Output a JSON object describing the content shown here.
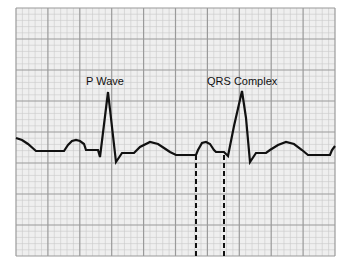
{
  "diagram": {
    "type": "ecg-strip",
    "labels": {
      "p_wave": "P Wave",
      "qrs_complex": "QRS Complex"
    },
    "colors": {
      "background": "#ffffff",
      "grid_fill": "#efefef",
      "grid_minor": "#c9c9c9",
      "grid_major": "#9a9a9a",
      "trace": "#111111",
      "marker": "#111111"
    },
    "grid": {
      "left": 16,
      "top": 8,
      "right": 335,
      "bottom": 256,
      "major_cols": 10,
      "major_rows": 8,
      "minor_per_major": 5
    },
    "trace_points": [
      [
        16,
        138
      ],
      [
        22,
        140
      ],
      [
        28,
        144
      ],
      [
        36,
        151
      ],
      [
        44,
        151
      ],
      [
        52,
        151
      ],
      [
        60,
        151
      ],
      [
        64,
        151
      ],
      [
        68,
        145
      ],
      [
        72,
        141
      ],
      [
        76,
        140
      ],
      [
        80,
        141
      ],
      [
        84,
        144
      ],
      [
        86,
        150
      ],
      [
        94,
        150
      ],
      [
        98,
        150
      ],
      [
        100,
        157
      ],
      [
        108,
        92
      ],
      [
        116,
        162
      ],
      [
        122,
        153
      ],
      [
        130,
        153
      ],
      [
        134,
        153
      ],
      [
        140,
        147
      ],
      [
        150,
        142
      ],
      [
        158,
        144
      ],
      [
        164,
        148
      ],
      [
        170,
        152
      ],
      [
        176,
        155
      ],
      [
        182,
        155
      ],
      [
        190,
        155
      ],
      [
        196,
        155
      ],
      [
        198,
        150
      ],
      [
        202,
        143
      ],
      [
        206,
        142
      ],
      [
        210,
        144
      ],
      [
        214,
        150
      ],
      [
        216,
        152
      ],
      [
        224,
        152
      ],
      [
        228,
        156
      ],
      [
        234,
        126
      ],
      [
        242,
        91
      ],
      [
        246,
        118
      ],
      [
        250,
        162
      ],
      [
        256,
        153
      ],
      [
        266,
        153
      ],
      [
        270,
        150
      ],
      [
        278,
        145
      ],
      [
        286,
        142
      ],
      [
        294,
        144
      ],
      [
        302,
        150
      ],
      [
        308,
        155
      ],
      [
        316,
        155
      ],
      [
        324,
        155
      ],
      [
        330,
        155
      ],
      [
        332,
        150
      ],
      [
        335,
        146
      ]
    ],
    "markers": [
      {
        "name": "pr-interval-start",
        "x": 196,
        "y1": 155,
        "y2": 256
      },
      {
        "name": "pr-interval-end",
        "x": 224,
        "y1": 155,
        "y2": 256
      }
    ],
    "label_positions": {
      "p_wave": {
        "x": 86,
        "y": 75
      },
      "qrs_complex": {
        "x": 207,
        "y": 75
      }
    }
  }
}
